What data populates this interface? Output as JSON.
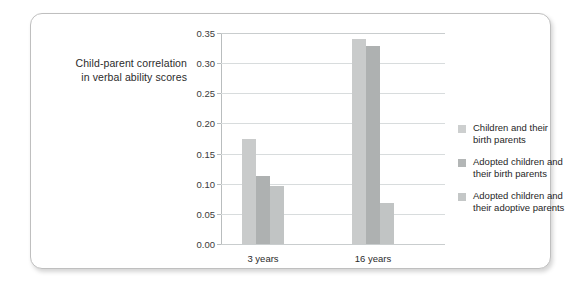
{
  "chart_data": {
    "type": "bar",
    "title": "",
    "subtitle": "",
    "xlabel": "",
    "ylabel_lines": [
      "Child-parent correlation",
      "in verbal ability scores"
    ],
    "ylabel": "Child-parent correlation in verbal ability scores",
    "categories": [
      "3 years",
      "16 years"
    ],
    "series": [
      {
        "name": "Children and their birth parents",
        "name_lines": [
          "Children and their",
          "birth parents"
        ],
        "color": "#c9cbcb",
        "values": [
          0.175,
          0.34
        ]
      },
      {
        "name": "Adopted children and their birth parents",
        "name_lines": [
          "Adopted children and",
          "their birth parents"
        ],
        "color": "#aeb1b1",
        "values": [
          0.112,
          0.329
        ]
      },
      {
        "name": "Adopted children and their adoptive parents",
        "name_lines": [
          "Adopted children and",
          "their adoptive parents"
        ],
        "color": "#c1c4c4",
        "values": [
          0.097,
          0.068
        ]
      }
    ],
    "ylim": [
      0.0,
      0.35
    ],
    "ytick_step": 0.05,
    "yticks": [
      0.0,
      0.05,
      0.1,
      0.15,
      0.2,
      0.25,
      0.3,
      0.35
    ],
    "ytick_labels": [
      "0.00",
      "0.05",
      "0.10",
      "0.15",
      "0.20",
      "0.25",
      "0.30",
      "0.35"
    ],
    "grid": true,
    "grid_axis": "y",
    "legend_position": "right",
    "colors": {
      "gridline": "#d8dcdd",
      "axis": "#b9bdbe",
      "text": "#2b2b2b",
      "card_border": "#bfbfbf",
      "card_background": "#ffffff"
    }
  }
}
